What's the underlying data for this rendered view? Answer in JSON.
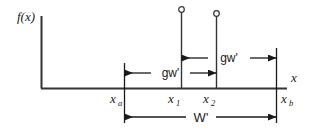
{
  "figure": {
    "axes": {
      "y_label": "f(x)",
      "x_label": "x"
    },
    "tick_labels": {
      "xa": "x",
      "xa_sub": "a",
      "x1": "x",
      "x1_sub": "1",
      "x2": "x",
      "x2_sub": "2",
      "xb": "x",
      "xb_sub": "b"
    },
    "dimensions": {
      "lower_span_label": "gw'",
      "upper_span_label": "gw'",
      "total_span_label": "W'"
    },
    "colors": {
      "line": "#333333",
      "text": "#1a1a1a",
      "background": "#ffffff"
    },
    "markers": {
      "open_circle_1": "open-circle",
      "open_circle_2": "open-circle"
    }
  }
}
